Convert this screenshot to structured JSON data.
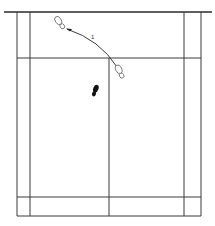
{
  "diagram": {
    "type": "badminton-court-footwork",
    "colors": {
      "court_lines": "#3a3a3a",
      "solid_footprint": "#111111",
      "outline_footprint": "#6a6a6a",
      "background": "#ffffff"
    },
    "court": {
      "net_line": {
        "x1": 4,
        "x2": 212,
        "y": 12
      },
      "outer_left_x": 17,
      "inner_left_x": 30,
      "center_x": 109,
      "inner_right_x": 184,
      "outer_right_x": 201,
      "short_service_y": 58,
      "long_service_y": 197,
      "back_line_y": 216
    },
    "footprints": [
      {
        "id": "start",
        "style": "solid",
        "x": 95,
        "y": 91
      },
      {
        "id": "left-forward",
        "style": "outline",
        "x": 61,
        "y": 24
      },
      {
        "id": "right-forward",
        "style": "outline",
        "x": 120,
        "y": 72
      }
    ],
    "movement": {
      "step_label": "1",
      "from": "right-forward",
      "to": "left-forward"
    }
  }
}
